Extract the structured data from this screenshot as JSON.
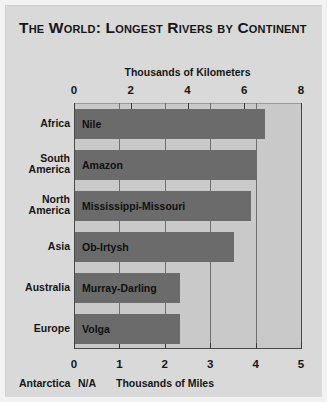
{
  "title": "The World: Longest Rivers by Continent",
  "chart_data": {
    "type": "bar",
    "orientation": "horizontal",
    "title": "The World: Longest Rivers by Continent",
    "categories": [
      "Africa",
      "South America",
      "North America",
      "Asia",
      "Australia",
      "Europe"
    ],
    "bar_labels": [
      "Nile",
      "Amazon",
      "Mississippi-Missouri",
      "Ob-Irtysh",
      "Murray-Darling",
      "Volga"
    ],
    "values_km_thousands": [
      6.7,
      6.4,
      6.2,
      5.6,
      3.7,
      3.7
    ],
    "values_miles_thousands": [
      4.16,
      3.98,
      3.86,
      3.48,
      2.3,
      2.3
    ],
    "top_axis": {
      "label": "Thousands of Kilometers",
      "ticks": [
        0,
        2,
        4,
        6,
        8
      ],
      "range": [
        0,
        8
      ]
    },
    "bottom_axis": {
      "label": "Thousands of Miles",
      "ticks": [
        0,
        1,
        2,
        3,
        4,
        5
      ],
      "range": [
        0,
        5
      ]
    },
    "ylabel": "",
    "grid": true,
    "legend": false,
    "note": {
      "category": "Antarctica",
      "value": "N/A"
    },
    "colors": {
      "bar": "#6b6b6b",
      "plot_background": "#c9c9c9",
      "figure_background": "#d9d9d9",
      "text": "#161616",
      "axis": "#4a4a4a"
    }
  },
  "footer": {
    "antarctica_label": "Antarctica",
    "antarctica_value": "N/A"
  }
}
